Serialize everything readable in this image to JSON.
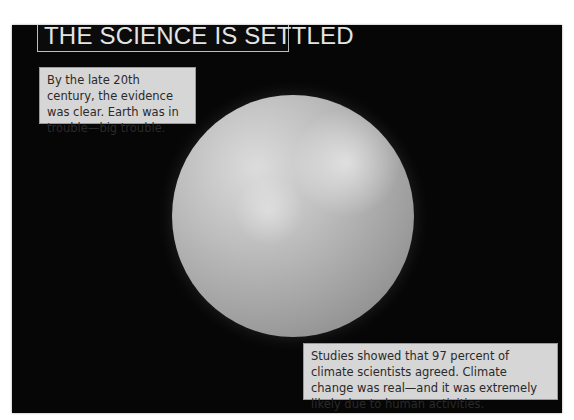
{
  "title": "THE SCIENCE IS SETTLED",
  "captions": [
    {
      "text": "By the late 20th century, the evidence was clear. Earth was in trouble—big trouble."
    },
    {
      "text": "Studies showed that 97 percent of climate scientists agreed. Climate change was real—and it was extremely likely due to human activities."
    }
  ],
  "image": {
    "subject": "earth-globe-in-space"
  },
  "colors": {
    "panel_bg": "#060606",
    "caption_bg": "#d6d6d6",
    "title_text": "#e4e4e4"
  }
}
